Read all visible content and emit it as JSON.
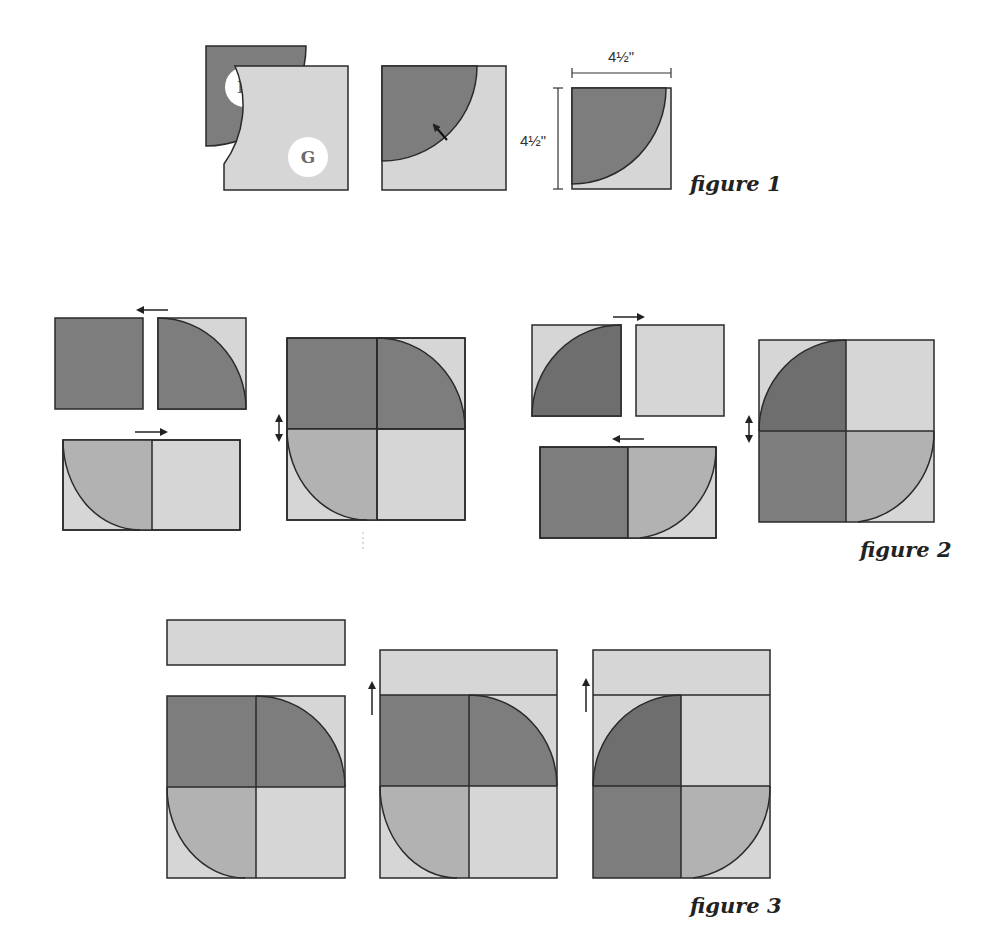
{
  "colors": {
    "dark": "#7d7d7d",
    "darkest": "#6e6e6e",
    "medium": "#b2b2b2",
    "light": "#d6d6d6",
    "outline": "#2a2a2a",
    "label_circle": "#ffffff"
  },
  "figure1": {
    "caption": "figure 1",
    "piece_h_label": "H",
    "piece_g_label": "G",
    "width_dimension": "4½\"",
    "height_dimension": "4½\""
  },
  "figure2": {
    "caption": "figure 2"
  },
  "figure3": {
    "caption": "figure 3"
  }
}
